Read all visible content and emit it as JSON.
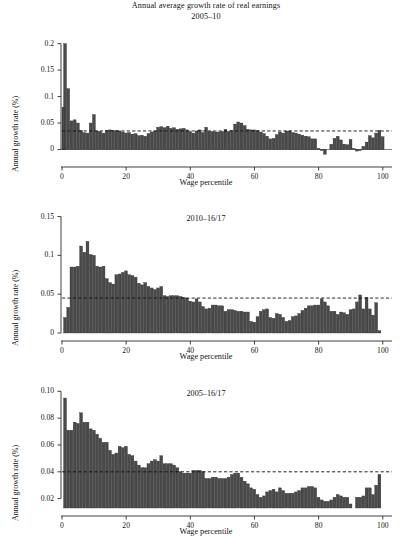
{
  "figure": {
    "title_line1": "Annual average growth rate of real earnings",
    "title_line2": "2005–10",
    "bar_color": "#4a4a4a",
    "bar_edge_color": "#2b2b2b",
    "axis_color": "#2b2b2b",
    "refline_color": "#111111",
    "background": "#ffffff"
  },
  "chart_data": [
    {
      "type": "bar",
      "title": "2005–10",
      "xlabel": "Wage percentile",
      "ylabel": "Annual growth rate (%)",
      "xlim": [
        0,
        101
      ],
      "ylim": [
        -0.018,
        0.205
      ],
      "xticks": [
        0,
        20,
        40,
        60,
        80,
        100
      ],
      "xticklabels": [
        "0",
        "20",
        "40",
        "60",
        "80",
        "100"
      ],
      "yticks": [
        0,
        0.05,
        0.1,
        0.15,
        0.2
      ],
      "yticklabels": [
        "0",
        "0.05",
        "0.1",
        "0.15",
        "0.2"
      ],
      "grid": false,
      "legend": "none",
      "reference_line": {
        "value": 0.035,
        "style": "dashed",
        "label": "mean"
      },
      "categories": [
        1,
        2,
        3,
        4,
        5,
        6,
        7,
        8,
        9,
        10,
        11,
        12,
        13,
        14,
        15,
        16,
        17,
        18,
        19,
        20,
        21,
        22,
        23,
        24,
        25,
        26,
        27,
        28,
        29,
        30,
        31,
        32,
        33,
        34,
        35,
        36,
        37,
        38,
        39,
        40,
        41,
        42,
        43,
        44,
        45,
        46,
        47,
        48,
        49,
        50,
        51,
        52,
        53,
        54,
        55,
        56,
        57,
        58,
        59,
        60,
        61,
        62,
        63,
        64,
        65,
        66,
        67,
        68,
        69,
        70,
        71,
        72,
        73,
        74,
        75,
        76,
        77,
        78,
        79,
        80,
        81,
        82,
        83,
        84,
        85,
        86,
        87,
        88,
        89,
        90,
        91,
        92,
        93,
        94,
        95,
        96,
        97,
        98,
        99,
        100
      ],
      "values": [
        0.2,
        0.115,
        0.054,
        0.056,
        0.05,
        0.036,
        0.032,
        0.031,
        0.05,
        0.066,
        0.035,
        0.034,
        0.031,
        0.036,
        0.037,
        0.036,
        0.036,
        0.035,
        0.033,
        0.031,
        0.032,
        0.029,
        0.03,
        0.026,
        0.027,
        0.025,
        0.03,
        0.033,
        0.035,
        0.042,
        0.043,
        0.041,
        0.044,
        0.04,
        0.041,
        0.038,
        0.039,
        0.04,
        0.037,
        0.034,
        0.031,
        0.035,
        0.037,
        0.032,
        0.042,
        0.034,
        0.034,
        0.033,
        0.033,
        0.034,
        0.038,
        0.034,
        0.036,
        0.048,
        0.052,
        0.05,
        0.045,
        0.038,
        0.037,
        0.037,
        0.036,
        0.033,
        0.03,
        0.025,
        0.02,
        0.021,
        0.028,
        0.033,
        0.031,
        0.035,
        0.035,
        0.032,
        0.031,
        0.029,
        0.027,
        0.025,
        0.024,
        0.02,
        0.02,
        0.002,
        -0.002,
        -0.009,
        0.0,
        0.01,
        0.021,
        0.025,
        0.018,
        0.01,
        0.009,
        0.019,
        0.002,
        -0.003,
        -0.002,
        0.006,
        0.014,
        0.026,
        0.022,
        0.031,
        0.036,
        0.024,
        0.08,
        0.002
      ]
    },
    {
      "type": "bar",
      "title": "2010–16/17",
      "xlabel": "Wage percentile",
      "ylabel": "Annual growth rate (%)",
      "xlim": [
        0,
        101
      ],
      "ylim": [
        0,
        0.152
      ],
      "xticks": [
        0,
        20,
        40,
        60,
        80,
        100
      ],
      "xticklabels": [
        "0",
        "20",
        "40",
        "60",
        "80",
        "100"
      ],
      "yticks": [
        0,
        0.05,
        0.1,
        0.15
      ],
      "yticklabels": [
        "0",
        "0.05",
        "0.1",
        "0.15"
      ],
      "grid": false,
      "legend": "none",
      "reference_line": {
        "value": 0.045,
        "style": "dashed",
        "label": "mean"
      },
      "categories": [
        1,
        2,
        3,
        4,
        5,
        6,
        7,
        8,
        9,
        10,
        11,
        12,
        13,
        14,
        15,
        16,
        17,
        18,
        19,
        20,
        21,
        22,
        23,
        24,
        25,
        26,
        27,
        28,
        29,
        30,
        31,
        32,
        33,
        34,
        35,
        36,
        37,
        38,
        39,
        40,
        41,
        42,
        43,
        44,
        45,
        46,
        47,
        48,
        49,
        50,
        51,
        52,
        53,
        54,
        55,
        56,
        57,
        58,
        59,
        60,
        61,
        62,
        63,
        64,
        65,
        66,
        67,
        68,
        69,
        70,
        71,
        72,
        73,
        74,
        75,
        76,
        77,
        78,
        79,
        80,
        81,
        82,
        83,
        84,
        85,
        86,
        87,
        88,
        89,
        90,
        91,
        92,
        93,
        94,
        95,
        96,
        97,
        98,
        99,
        100
      ],
      "values": [
        0.02,
        0.033,
        0.085,
        0.085,
        0.086,
        0.112,
        0.104,
        0.118,
        0.101,
        0.1,
        0.086,
        0.085,
        0.086,
        0.07,
        0.065,
        0.063,
        0.075,
        0.076,
        0.078,
        0.08,
        0.075,
        0.074,
        0.072,
        0.064,
        0.062,
        0.065,
        0.06,
        0.058,
        0.056,
        0.058,
        0.06,
        0.048,
        0.047,
        0.048,
        0.048,
        0.048,
        0.047,
        0.046,
        0.045,
        0.041,
        0.04,
        0.044,
        0.04,
        0.034,
        0.031,
        0.032,
        0.036,
        0.036,
        0.035,
        0.035,
        0.028,
        0.03,
        0.03,
        0.029,
        0.028,
        0.028,
        0.027,
        0.027,
        0.015,
        0.014,
        0.021,
        0.028,
        0.03,
        0.031,
        0.02,
        0.019,
        0.025,
        0.024,
        0.02,
        0.015,
        0.016,
        0.021,
        0.022,
        0.025,
        0.029,
        0.032,
        0.035,
        0.035,
        0.036,
        0.036,
        0.044,
        0.04,
        0.035,
        0.028,
        0.028,
        0.024,
        0.027,
        0.026,
        0.024,
        0.03,
        0.031,
        0.04,
        0.049,
        0.031,
        0.046,
        0.031,
        0.023,
        0.039,
        0.003
      ]
    },
    {
      "type": "bar",
      "title": "2005–16/17",
      "xlabel": "Wage percentile",
      "ylabel": "Annual growth rate (%)",
      "xlim": [
        0,
        101
      ],
      "ylim": [
        0.013,
        0.101
      ],
      "xticks": [
        0,
        20,
        40,
        60,
        80,
        100
      ],
      "xticklabels": [
        "0",
        "20",
        "40",
        "60",
        "80",
        "100"
      ],
      "yticks": [
        0.02,
        0.04,
        0.06,
        0.08,
        0.1
      ],
      "yticklabels": [
        "0.02",
        "0.04",
        "0.06",
        "0.08",
        "0.10"
      ],
      "grid": false,
      "legend": "none",
      "reference_line": {
        "value": 0.04,
        "style": "dashed",
        "label": "mean"
      },
      "categories": [
        1,
        2,
        3,
        4,
        5,
        6,
        7,
        8,
        9,
        10,
        11,
        12,
        13,
        14,
        15,
        16,
        17,
        18,
        19,
        20,
        21,
        22,
        23,
        24,
        25,
        26,
        27,
        28,
        29,
        30,
        31,
        32,
        33,
        34,
        35,
        36,
        37,
        38,
        39,
        40,
        41,
        42,
        43,
        44,
        45,
        46,
        47,
        48,
        49,
        50,
        51,
        52,
        53,
        54,
        55,
        56,
        57,
        58,
        59,
        60,
        61,
        62,
        63,
        64,
        65,
        66,
        67,
        68,
        69,
        70,
        71,
        72,
        73,
        74,
        75,
        76,
        77,
        78,
        79,
        80,
        81,
        82,
        83,
        84,
        85,
        86,
        87,
        88,
        89,
        90,
        91,
        92,
        93,
        94,
        95,
        96,
        97,
        98,
        99,
        100
      ],
      "values": [
        0.095,
        0.071,
        0.071,
        0.077,
        0.076,
        0.084,
        0.077,
        0.077,
        0.072,
        0.071,
        0.068,
        0.065,
        0.062,
        0.062,
        0.056,
        0.053,
        0.054,
        0.059,
        0.058,
        0.059,
        0.053,
        0.052,
        0.048,
        0.045,
        0.043,
        0.043,
        0.046,
        0.048,
        0.049,
        0.048,
        0.052,
        0.046,
        0.046,
        0.046,
        0.045,
        0.043,
        0.04,
        0.039,
        0.039,
        0.039,
        0.041,
        0.041,
        0.041,
        0.04,
        0.035,
        0.035,
        0.036,
        0.036,
        0.035,
        0.035,
        0.035,
        0.036,
        0.038,
        0.039,
        0.039,
        0.036,
        0.033,
        0.031,
        0.028,
        0.027,
        0.023,
        0.021,
        0.022,
        0.025,
        0.026,
        0.027,
        0.025,
        0.028,
        0.026,
        0.024,
        0.024,
        0.024,
        0.025,
        0.026,
        0.028,
        0.028,
        0.029,
        0.029,
        0.028,
        0.021,
        0.019,
        0.018,
        0.018,
        0.019,
        0.021,
        0.023,
        0.022,
        0.021,
        0.021,
        0.016,
        0.013,
        0.021,
        0.021,
        0.022,
        0.028,
        0.028,
        0.023,
        0.03,
        0.038,
        0.013
      ]
    }
  ]
}
